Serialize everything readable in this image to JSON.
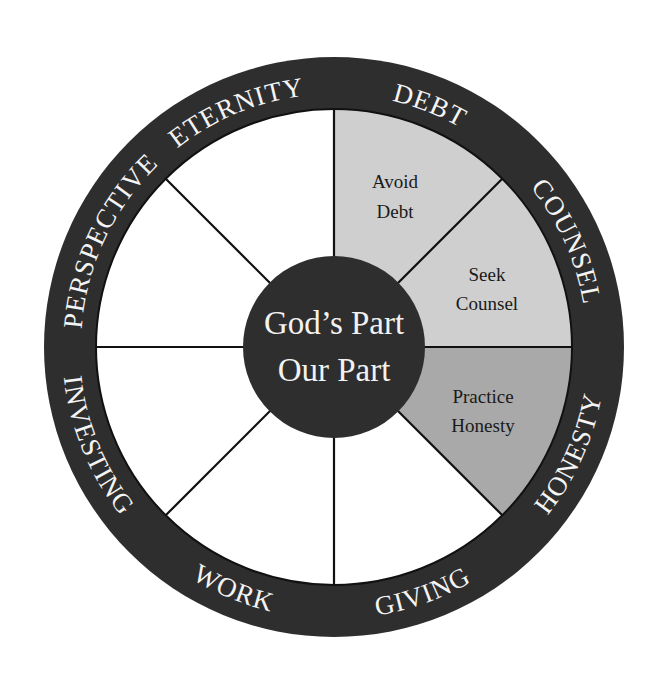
{
  "diagram": {
    "hub": {
      "line1": "God’s Part",
      "line2": "Our Part"
    },
    "ring_labels": [
      {
        "key": "perspective",
        "text": "PERSPECTIVE",
        "arc": "top",
        "offset": "14%"
      },
      {
        "key": "eternity",
        "text": "ETERNITY",
        "arc": "top",
        "offset": "37.5%"
      },
      {
        "key": "debt",
        "text": "DEBT",
        "arc": "top",
        "offset": "62%"
      },
      {
        "key": "counsel",
        "text": "COUNSEL",
        "arc": "top",
        "offset": "86.5%"
      },
      {
        "key": "investing",
        "text": "INVESTING",
        "arc": "bottom",
        "offset": "12.5%"
      },
      {
        "key": "work",
        "text": "WORK",
        "arc": "bottom",
        "offset": "37.5%"
      },
      {
        "key": "giving",
        "text": "GIVING",
        "arc": "bottom",
        "offset": "61%"
      },
      {
        "key": "honesty",
        "text": "HONESTY",
        "arc": "bottom",
        "offset": "86.5%"
      }
    ],
    "segments": [
      {
        "key": "debt",
        "line1": "Avoid",
        "line2": "Debt",
        "fill": "#cfcfcf"
      },
      {
        "key": "counsel",
        "line1": "Seek",
        "line2": "Counsel",
        "fill": "#cfcfcf"
      },
      {
        "key": "honesty",
        "line1": "Practice",
        "line2": "Honesty",
        "fill": "#a9a9a9"
      },
      {
        "key": "giving",
        "line1": "",
        "line2": "",
        "fill": "#ffffff"
      },
      {
        "key": "work",
        "line1": "",
        "line2": "",
        "fill": "#ffffff"
      },
      {
        "key": "investing",
        "line1": "",
        "line2": "",
        "fill": "#ffffff"
      },
      {
        "key": "perspective",
        "line1": "",
        "line2": "",
        "fill": "#ffffff"
      },
      {
        "key": "eternity",
        "line1": "",
        "line2": "",
        "fill": "#ffffff"
      }
    ],
    "colors": {
      "ring": "#2e2e2e",
      "hub": "#2e2e2e",
      "light_segment": "#cfcfcf",
      "mid_segment": "#a9a9a9",
      "empty_segment": "#ffffff",
      "spoke": "#111111"
    }
  }
}
